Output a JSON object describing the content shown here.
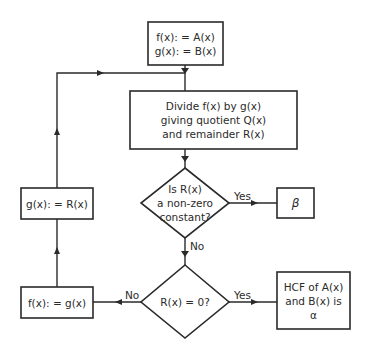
{
  "diagram": {
    "type": "flowchart",
    "nodes": {
      "init": {
        "lines": [
          "f(x): = A(x)",
          "g(x): = B(x)"
        ]
      },
      "divide": {
        "lines": [
          "Divide f(x) by g(x)",
          "giving quotient Q(x)",
          "and remainder R(x)"
        ]
      },
      "decision_nonzero": {
        "lines": [
          "Is R(x)",
          "a non-zero",
          "constant?"
        ]
      },
      "result_beta": {
        "lines": [
          "β"
        ]
      },
      "decision_zero": {
        "lines": [
          "R(x) = 0?"
        ]
      },
      "result_hcf": {
        "lines": [
          "HCF of A(x)",
          "and B(x) is",
          "α"
        ]
      },
      "assign_f": {
        "lines": [
          "f(x): = g(x)"
        ]
      },
      "assign_g": {
        "lines": [
          "g(x): = R(x)"
        ]
      }
    },
    "edges": [
      {
        "from": "init",
        "to": "divide",
        "label": ""
      },
      {
        "from": "divide",
        "to": "decision_nonzero",
        "label": ""
      },
      {
        "from": "decision_nonzero",
        "to": "result_beta",
        "label": "Yes"
      },
      {
        "from": "decision_nonzero",
        "to": "decision_zero",
        "label": "No"
      },
      {
        "from": "decision_zero",
        "to": "result_hcf",
        "label": "Yes"
      },
      {
        "from": "decision_zero",
        "to": "assign_f",
        "label": "No"
      },
      {
        "from": "assign_f",
        "to": "assign_g",
        "label": ""
      },
      {
        "from": "assign_g",
        "to": "divide",
        "label": ""
      }
    ],
    "edge_labels": {
      "nonzero_yes": "Yes",
      "nonzero_no": "No",
      "zero_yes": "Yes",
      "zero_no": "No"
    }
  }
}
